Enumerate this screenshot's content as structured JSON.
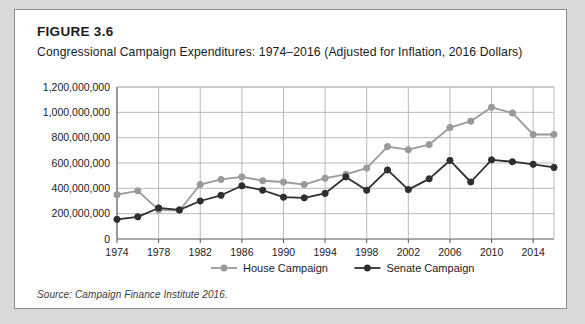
{
  "figure": {
    "number": "FIGURE 3.6",
    "title": "Congressional Campaign Expenditures: 1974–2016 (Adjusted for Inflation, 2016 Dollars)",
    "source": "Source: Campaign Finance Institute 2016."
  },
  "colors": {
    "house": "#9a9a9a",
    "senate": "#2f2f2f",
    "grid": "#b9b9b9",
    "axis": "#555555",
    "panel_border": "#8d8d8d",
    "page_background": "#d9d9d7"
  },
  "chart_data": {
    "type": "line",
    "title": "Congressional Campaign Expenditures: 1974–2016 (Adjusted for Inflation, 2016 Dollars)",
    "xlabel": "",
    "ylabel": "",
    "ylim": [
      0,
      1200000000
    ],
    "ytick_labels": [
      "0",
      "200,000,000",
      "400,000,000",
      "600,000,000",
      "800,000,000",
      "1,000,000,000",
      "1,200,000,000"
    ],
    "ytick_values": [
      0,
      200000000,
      400000000,
      600000000,
      800000000,
      1000000000,
      1200000000
    ],
    "xlim": [
      1974,
      2016
    ],
    "x": [
      1974,
      1976,
      1978,
      1980,
      1982,
      1984,
      1986,
      1988,
      1990,
      1992,
      1994,
      1996,
      1998,
      2000,
      2002,
      2004,
      2006,
      2008,
      2010,
      2012,
      2014,
      2016
    ],
    "xtick_labels": [
      "1974",
      "1978",
      "1982",
      "1986",
      "1990",
      "1994",
      "1998",
      "2002",
      "2006",
      "2010",
      "2014"
    ],
    "xtick_values": [
      1974,
      1978,
      1982,
      1986,
      1990,
      1994,
      1998,
      2002,
      2006,
      2010,
      2014
    ],
    "grid": true,
    "legend_position": "bottom",
    "series": [
      {
        "name": "House Campaign",
        "color": "#9a9a9a",
        "marker": "circle",
        "values": [
          350000000,
          380000000,
          230000000,
          225000000,
          430000000,
          470000000,
          490000000,
          460000000,
          450000000,
          430000000,
          480000000,
          510000000,
          560000000,
          730000000,
          705000000,
          745000000,
          880000000,
          930000000,
          1040000000,
          995000000,
          825000000,
          825000000
        ]
      },
      {
        "name": "Senate Campaign",
        "color": "#2f2f2f",
        "marker": "circle",
        "values": [
          155000000,
          175000000,
          245000000,
          230000000,
          300000000,
          345000000,
          420000000,
          385000000,
          330000000,
          325000000,
          360000000,
          490000000,
          385000000,
          545000000,
          390000000,
          475000000,
          620000000,
          450000000,
          625000000,
          610000000,
          590000000,
          565000000
        ]
      }
    ]
  },
  "legend": [
    {
      "label": "House Campaign",
      "color": "#9a9a9a"
    },
    {
      "label": "Senate Campaign",
      "color": "#2f2f2f"
    }
  ]
}
